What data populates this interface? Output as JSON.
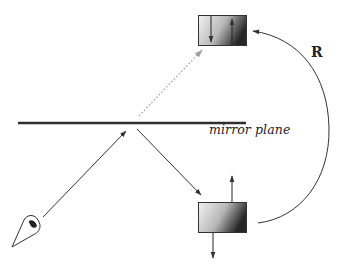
{
  "diagram": {
    "labels": {
      "mirror_plane": "mirror plane",
      "operation": "R"
    },
    "caption": {
      "text": "",
      "visible": "partially cut off, illegible"
    },
    "elements": [
      {
        "id": "observer-eye",
        "type": "eye-icon"
      },
      {
        "id": "mirror-plane",
        "type": "horizontal-line"
      },
      {
        "id": "incident-ray",
        "type": "arrow",
        "from": "observer-eye",
        "to": "mirror-plane"
      },
      {
        "id": "reflected-ray",
        "type": "arrow",
        "from": "mirror-plane",
        "to": "object-box"
      },
      {
        "id": "virtual-ray",
        "type": "dotted-arrow",
        "from": "mirror-plane",
        "to": "image-box"
      },
      {
        "id": "object-box",
        "type": "gradient-box",
        "arrows": [
          "up (above box)",
          "down (below box)"
        ]
      },
      {
        "id": "image-box",
        "type": "gradient-box",
        "arrows": [
          "down (inside)",
          "up (inside)"
        ]
      },
      {
        "id": "operation-arc",
        "type": "curved-arrow",
        "from": "object-box",
        "to": "image-box",
        "label": "R"
      }
    ],
    "colors": {
      "line": "#333333",
      "dotted": "#9a9a9a",
      "box_light": "#f0f0f0",
      "box_dark": "#2a2a2a"
    }
  }
}
